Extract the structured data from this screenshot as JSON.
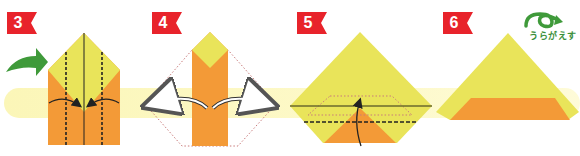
{
  "colors": {
    "badge_red": "#e8232b",
    "paper_yellow": "#e9e45a",
    "paper_yellow_light": "#eeea6e",
    "paper_orange": "#f39a37",
    "guide_band": "#fbf6b8",
    "arrow_green": "#3f9a3a",
    "fold_line": "#222222",
    "dotted_outline": "#c97b7b"
  },
  "steps": [
    {
      "number": "3",
      "description": "Fold both sides to the center line (valley folds)",
      "icon": "turn-over-arrow-icon"
    },
    {
      "number": "4",
      "description": "Unfold both sides back out"
    },
    {
      "number": "5",
      "description": "Fold the bottom point up along the dashed line"
    },
    {
      "number": "6",
      "description": "Turn the model over",
      "flip_label": "うらがえす",
      "icon": "flip-over-icon"
    }
  ]
}
